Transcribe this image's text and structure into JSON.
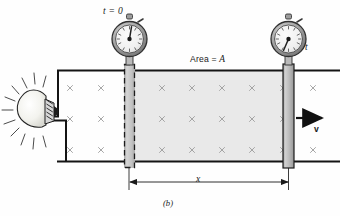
{
  "figure": {
    "caption": "(b)",
    "labels": {
      "time_initial": "t = 0",
      "time_final": "t",
      "area_text": "Area = ",
      "area_symbol": "A",
      "distance": "x",
      "velocity": "v"
    },
    "colors": {
      "ink": "#1a1a1a",
      "bar_fill": "#bdbdbd",
      "bar_stroke": "#2b2b2b",
      "region_fill": "#e9e9e9",
      "field_mark": "#9a9a9a",
      "watch_body": "#9e9e9e",
      "watch_face": "#f2f2f2",
      "bulb_fill": "#f4f4f0",
      "page": "#fefefe"
    },
    "elements": {
      "lamp": "light-bulb",
      "stopwatch_left": "stopwatch-start",
      "stopwatch_right": "stopwatch-elapsed",
      "bar_dashed": "conducting-bar-initial-position",
      "bar_solid": "conducting-bar-moving",
      "rail_top": "conducting-rail-top",
      "rail_bottom": "conducting-rail-bottom",
      "field_region": "magnetic-field-into-page",
      "swept_area": "swept-area-region",
      "dimension": "distance-dimension-line",
      "velocity_arrow": "velocity-arrow"
    },
    "field": {
      "symbol": "x",
      "columns_x": [
        70,
        101,
        131,
        162,
        192,
        222,
        252,
        283,
        313
      ],
      "rows_y": [
        88,
        119,
        150
      ]
    },
    "geometry": {
      "rail_top_y": 70,
      "rail_bottom_y": 161,
      "rail_left_x": 57,
      "rail_right_x": 340,
      "bar_dashed_x": 124,
      "bar_solid_x": 283,
      "bar_width": 11,
      "dimension_y": 182
    }
  }
}
